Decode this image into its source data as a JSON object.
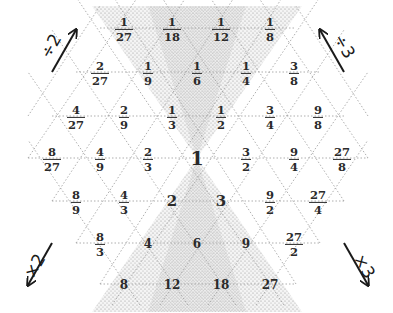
{
  "diagram": {
    "title": "",
    "center_value": "1",
    "shading": "hourglass stippled region through the 1, covering the column of powers of 6",
    "arrows": {
      "top_left": {
        "label": "÷2",
        "direction": "up-right"
      },
      "top_right": {
        "label": "÷3",
        "direction": "up-left"
      },
      "bottom_left": {
        "label": "×2",
        "direction": "down-left"
      },
      "bottom_right": {
        "label": "×3",
        "direction": "down-right"
      }
    },
    "rows": [
      {
        "y": 28,
        "cells": [
          {
            "x": 124,
            "num": "1",
            "den": "27"
          },
          {
            "x": 172,
            "num": "1",
            "den": "18"
          },
          {
            "x": 221,
            "num": "1",
            "den": "12"
          },
          {
            "x": 270,
            "num": "1",
            "den": "8"
          }
        ]
      },
      {
        "y": 72,
        "cells": [
          {
            "x": 100,
            "num": "2",
            "den": "27"
          },
          {
            "x": 148,
            "num": "1",
            "den": "9"
          },
          {
            "x": 197,
            "num": "1",
            "den": "6"
          },
          {
            "x": 246,
            "num": "1",
            "den": "4"
          },
          {
            "x": 294,
            "num": "3",
            "den": "8"
          }
        ]
      },
      {
        "y": 116,
        "cells": [
          {
            "x": 76,
            "num": "4",
            "den": "27"
          },
          {
            "x": 124,
            "num": "2",
            "den": "9"
          },
          {
            "x": 172,
            "num": "1",
            "den": "3"
          },
          {
            "x": 221,
            "num": "1",
            "den": "2"
          },
          {
            "x": 270,
            "num": "3",
            "den": "4"
          },
          {
            "x": 318,
            "num": "9",
            "den": "8"
          }
        ]
      },
      {
        "y": 158,
        "cells": [
          {
            "x": 52,
            "num": "8",
            "den": "27"
          },
          {
            "x": 100,
            "num": "4",
            "den": "9"
          },
          {
            "x": 148,
            "num": "2",
            "den": "3"
          },
          {
            "x": 197,
            "int": "1",
            "size": "big"
          },
          {
            "x": 246,
            "num": "3",
            "den": "2"
          },
          {
            "x": 294,
            "num": "9",
            "den": "4"
          },
          {
            "x": 342,
            "num": "27",
            "den": "8"
          }
        ]
      },
      {
        "y": 201,
        "cells": [
          {
            "x": 76,
            "num": "8",
            "den": "9"
          },
          {
            "x": 124,
            "num": "4",
            "den": "3"
          },
          {
            "x": 172,
            "int": "2",
            "size": "mid"
          },
          {
            "x": 221,
            "int": "3",
            "size": "mid"
          },
          {
            "x": 270,
            "num": "9",
            "den": "2"
          },
          {
            "x": 318,
            "num": "27",
            "den": "4"
          }
        ]
      },
      {
        "y": 243,
        "cells": [
          {
            "x": 100,
            "num": "8",
            "den": "3"
          },
          {
            "x": 148,
            "int": "4"
          },
          {
            "x": 197,
            "int": "6"
          },
          {
            "x": 246,
            "int": "9"
          },
          {
            "x": 294,
            "num": "27",
            "den": "2"
          }
        ]
      },
      {
        "y": 284,
        "cells": [
          {
            "x": 124,
            "int": "8"
          },
          {
            "x": 172,
            "int": "12"
          },
          {
            "x": 221,
            "int": "18"
          },
          {
            "x": 270,
            "int": "27"
          }
        ]
      }
    ]
  }
}
